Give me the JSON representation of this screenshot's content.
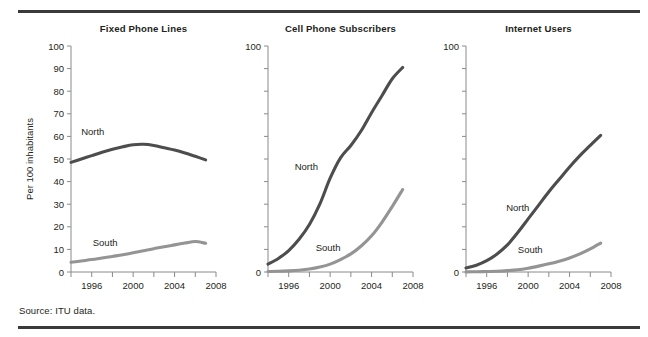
{
  "figure": {
    "source_note": "Source: ITU data.",
    "y_axis_title": "Per 100 inhabitants",
    "colors": {
      "north": "#4d4d4d",
      "south": "#949494",
      "axis": "#8a8a8a",
      "rule": "#3a3a3a",
      "text": "#231f20",
      "background": "#ffffff"
    }
  },
  "chart_data": [
    {
      "type": "line",
      "title": "Fixed Phone Lines",
      "xlabel": "",
      "ylabel": "Per 100 inhabitants",
      "xlim": [
        1994,
        2008
      ],
      "ylim": [
        0,
        100
      ],
      "xticks": [
        1994,
        1996,
        1998,
        2000,
        2002,
        2004,
        2006,
        2008
      ],
      "xticklabels": [
        "",
        "1996",
        "",
        "2000",
        "",
        "2004",
        "",
        "2008"
      ],
      "yticks": [
        0,
        10,
        20,
        30,
        40,
        50,
        60,
        70,
        80,
        90,
        100
      ],
      "yticklabels": [
        "0",
        "10",
        "20",
        "30",
        "40",
        "50",
        "60",
        "70",
        "80",
        "90",
        "100"
      ],
      "grid": false,
      "legend": "inline-labels",
      "x": [
        1994,
        1995,
        1996,
        1997,
        1998,
        1999,
        2000,
        2001,
        2002,
        2003,
        2004,
        2005,
        2006,
        2007
      ],
      "series": [
        {
          "name": "North",
          "color": "#4d4d4d",
          "label_x": 1996.1,
          "label_y": 60.5,
          "values": [
            48.5,
            50.0,
            51.5,
            53.0,
            54.3,
            55.4,
            56.3,
            56.5,
            56.0,
            55.0,
            54.0,
            52.7,
            51.2,
            49.6
          ]
        },
        {
          "name": "South",
          "color": "#949494",
          "label_x": 1997.3,
          "label_y": 11.5,
          "values": [
            4.3,
            4.9,
            5.5,
            6.2,
            6.9,
            7.6,
            8.5,
            9.4,
            10.3,
            11.2,
            12.0,
            12.8,
            13.5,
            12.7
          ]
        }
      ]
    },
    {
      "type": "line",
      "title": "Cell Phone Subscribers",
      "xlabel": "",
      "ylabel": "",
      "xlim": [
        1994,
        2008
      ],
      "ylim": [
        0,
        100
      ],
      "xticks": [
        1994,
        1996,
        1998,
        2000,
        2002,
        2004,
        2006,
        2008
      ],
      "xticklabels": [
        "",
        "1996",
        "",
        "2000",
        "",
        "2004",
        "",
        "2008"
      ],
      "yticks": [
        0,
        10,
        20,
        30,
        40,
        50,
        60,
        70,
        80,
        90,
        100
      ],
      "yticklabels": [
        "0",
        "",
        "",
        "",
        "",
        "",
        "",
        "",
        "",
        "",
        "100"
      ],
      "grid": false,
      "legend": "inline-labels",
      "x": [
        1994,
        1995,
        1996,
        1997,
        1998,
        1999,
        2000,
        2001,
        2002,
        2003,
        2004,
        2005,
        2006,
        2007
      ],
      "series": [
        {
          "name": "North",
          "color": "#4d4d4d",
          "label_x": 1997.7,
          "label_y": 45.0,
          "values": [
            3.5,
            6.0,
            9.5,
            14.5,
            21.0,
            30.0,
            41.5,
            50.5,
            56.0,
            62.5,
            70.5,
            78.0,
            85.5,
            90.5
          ]
        },
        {
          "name": "South",
          "color": "#949494",
          "label_x": 1999.8,
          "label_y": 9.5,
          "values": [
            0.2,
            0.3,
            0.5,
            0.8,
            1.3,
            2.2,
            3.5,
            5.5,
            8.0,
            11.5,
            16.0,
            22.0,
            29.0,
            36.5
          ]
        }
      ]
    },
    {
      "type": "line",
      "title": "Internet Users",
      "xlabel": "",
      "ylabel": "",
      "xlim": [
        1994,
        2008
      ],
      "ylim": [
        0,
        100
      ],
      "xticks": [
        1994,
        1996,
        1998,
        2000,
        2002,
        2004,
        2006,
        2008
      ],
      "xticklabels": [
        "",
        "1996",
        "",
        "2000",
        "",
        "2004",
        "",
        "2008"
      ],
      "yticks": [
        0,
        10,
        20,
        30,
        40,
        50,
        60,
        70,
        80,
        90,
        100
      ],
      "yticklabels": [
        "0",
        "",
        "",
        "",
        "",
        "",
        "",
        "",
        "",
        "",
        "100"
      ],
      "grid": false,
      "legend": "inline-labels",
      "x": [
        1994,
        1995,
        1996,
        1997,
        1998,
        1999,
        2000,
        2001,
        2002,
        2003,
        2004,
        2005,
        2006,
        2007
      ],
      "series": [
        {
          "name": "North",
          "color": "#4d4d4d",
          "label_x": 1999.0,
          "label_y": 27.0,
          "values": [
            1.8,
            3.0,
            5.0,
            8.0,
            12.0,
            17.5,
            23.5,
            29.5,
            35.5,
            41.0,
            46.5,
            51.5,
            56.0,
            60.5
          ]
        },
        {
          "name": "South",
          "color": "#949494",
          "label_x": 2000.2,
          "label_y": 8.5,
          "values": [
            0.05,
            0.1,
            0.2,
            0.3,
            0.6,
            1.0,
            1.7,
            2.6,
            3.6,
            4.8,
            6.2,
            8.0,
            10.2,
            12.8
          ]
        }
      ]
    }
  ]
}
